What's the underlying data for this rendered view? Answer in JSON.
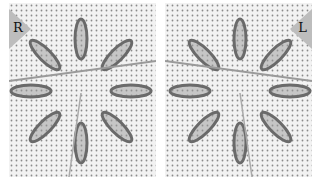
{
  "figure": {
    "panels": [
      {
        "id": "left",
        "label": "R",
        "corner": "top-left",
        "description": "Eight-petal lazy daisy stitch star on cross-stitch fabric, worked right-handed, with needle"
      },
      {
        "id": "right",
        "label": "L",
        "corner": "top-right",
        "description": "Eight-petal lazy daisy stitch star on cross-stitch fabric, worked left-handed, with needle"
      }
    ],
    "colors": {
      "fabric": "#f2f2f2",
      "fabric_dots": "#8a8a8a",
      "thread": "#6a6a6a",
      "thread_dark": "#3a3a3a",
      "needle": "#9a9a9a",
      "label_triangle": "#bdbdbd",
      "label_text": "#111111"
    }
  }
}
